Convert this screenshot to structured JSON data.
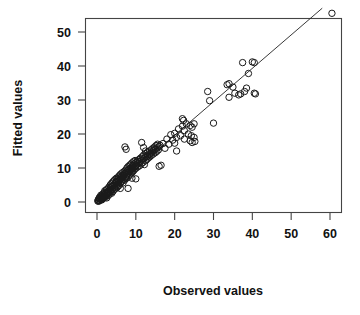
{
  "chart_data": {
    "type": "scatter",
    "title": "",
    "xlabel": "Observed values",
    "ylabel": "Fitted values",
    "xlim": [
      -2,
      63
    ],
    "ylim": [
      -2,
      58
    ],
    "xticks": [
      0,
      10,
      20,
      30,
      40,
      50,
      60
    ],
    "yticks": [
      0,
      10,
      20,
      30,
      40,
      50
    ],
    "xtick_labels": [
      "0",
      "10",
      "20",
      "30",
      "40",
      "50",
      "60"
    ],
    "ytick_labels": [
      "0",
      "10",
      "20",
      "30",
      "40",
      "50"
    ],
    "grid": false,
    "legend": null,
    "marker": "open-circle",
    "marker_color": "#1a1a1a",
    "reference_line": {
      "type": "identity",
      "label": "",
      "x": [
        0,
        58
      ],
      "y": [
        0,
        57
      ],
      "color": "#222222"
    },
    "points": [
      [
        0.2,
        0.3
      ],
      [
        0.3,
        0.6
      ],
      [
        0.4,
        0.2
      ],
      [
        0.5,
        1.0
      ],
      [
        0.5,
        0.4
      ],
      [
        0.6,
        1.3
      ],
      [
        0.7,
        0.5
      ],
      [
        0.8,
        0.9
      ],
      [
        0.9,
        1.6
      ],
      [
        1.0,
        0.7
      ],
      [
        1.0,
        2.0
      ],
      [
        1.1,
        1.2
      ],
      [
        1.2,
        0.6
      ],
      [
        1.3,
        1.8
      ],
      [
        1.4,
        1.1
      ],
      [
        1.5,
        2.4
      ],
      [
        1.5,
        0.9
      ],
      [
        1.6,
        1.5
      ],
      [
        1.7,
        2.2
      ],
      [
        1.8,
        1.3
      ],
      [
        1.9,
        2.8
      ],
      [
        2.0,
        1.7
      ],
      [
        2.0,
        3.3
      ],
      [
        2.1,
        2.1
      ],
      [
        2.2,
        1.4
      ],
      [
        2.3,
        2.6
      ],
      [
        2.4,
        3.6
      ],
      [
        2.5,
        2.0
      ],
      [
        2.5,
        1.2
      ],
      [
        2.6,
        3.0
      ],
      [
        2.7,
        2.4
      ],
      [
        2.8,
        4.0
      ],
      [
        2.9,
        1.9
      ],
      [
        3.0,
        3.2
      ],
      [
        3.0,
        2.7
      ],
      [
        3.1,
        4.4
      ],
      [
        3.2,
        2.3
      ],
      [
        3.3,
        3.7
      ],
      [
        3.4,
        5.0
      ],
      [
        3.5,
        2.9
      ],
      [
        3.5,
        4.1
      ],
      [
        3.6,
        3.4
      ],
      [
        3.7,
        5.4
      ],
      [
        3.8,
        2.6
      ],
      [
        3.9,
        4.6
      ],
      [
        4.0,
        3.9
      ],
      [
        4.0,
        5.8
      ],
      [
        4.1,
        3.1
      ],
      [
        4.2,
        4.9
      ],
      [
        4.3,
        6.2
      ],
      [
        4.4,
        3.6
      ],
      [
        4.5,
        5.2
      ],
      [
        4.5,
        4.3
      ],
      [
        4.6,
        6.6
      ],
      [
        4.7,
        3.9
      ],
      [
        4.8,
        5.6
      ],
      [
        4.9,
        4.7
      ],
      [
        5.0,
        6.0
      ],
      [
        5.0,
        7.0
      ],
      [
        5.1,
        4.2
      ],
      [
        5.2,
        5.9
      ],
      [
        5.3,
        6.8
      ],
      [
        5.4,
        4.6
      ],
      [
        5.5,
        5.3
      ],
      [
        5.5,
        7.4
      ],
      [
        5.6,
        6.3
      ],
      [
        5.7,
        4.9
      ],
      [
        5.8,
        7.8
      ],
      [
        5.9,
        6.6
      ],
      [
        6.0,
        5.5
      ],
      [
        6.0,
        7.2
      ],
      [
        6.1,
        8.2
      ],
      [
        6.2,
        5.9
      ],
      [
        6.3,
        6.9
      ],
      [
        6.4,
        7.6
      ],
      [
        6.5,
        6.2
      ],
      [
        6.5,
        8.6
      ],
      [
        6.6,
        7.3
      ],
      [
        6.7,
        5.6
      ],
      [
        6.8,
        8.0
      ],
      [
        6.9,
        6.7
      ],
      [
        7.0,
        7.9
      ],
      [
        7.0,
        9.0
      ],
      [
        7.1,
        6.4
      ],
      [
        7.2,
        8.4
      ],
      [
        7.3,
        7.1
      ],
      [
        7.4,
        9.4
      ],
      [
        7.5,
        6.9
      ],
      [
        7.5,
        8.8
      ],
      [
        7.6,
        7.5
      ],
      [
        7.7,
        10.0
      ],
      [
        7.8,
        8.1
      ],
      [
        7.9,
        9.2
      ],
      [
        8.0,
        7.3
      ],
      [
        8.0,
        10.4
      ],
      [
        8.1,
        8.7
      ],
      [
        8.2,
        9.6
      ],
      [
        8.3,
        7.8
      ],
      [
        8.4,
        10.8
      ],
      [
        8.5,
        9.1
      ],
      [
        8.5,
        8.2
      ],
      [
        8.6,
        10.0
      ],
      [
        8.7,
        11.1
      ],
      [
        8.8,
        9.4
      ],
      [
        8.9,
        8.6
      ],
      [
        9.0,
        10.3
      ],
      [
        9.0,
        11.5
      ],
      [
        9.1,
        9.8
      ],
      [
        9.2,
        8.9
      ],
      [
        9.3,
        10.7
      ],
      [
        9.4,
        11.9
      ],
      [
        9.5,
        9.3
      ],
      [
        9.5,
        10.1
      ],
      [
        9.6,
        11.2
      ],
      [
        9.7,
        9.7
      ],
      [
        9.8,
        12.2
      ],
      [
        9.9,
        10.5
      ],
      [
        10.0,
        11.6
      ],
      [
        10.0,
        9.9
      ],
      [
        10.2,
        10.9
      ],
      [
        10.4,
        12.0
      ],
      [
        10.5,
        10.3
      ],
      [
        10.6,
        11.4
      ],
      [
        10.8,
        12.5
      ],
      [
        11.0,
        10.7
      ],
      [
        11.0,
        11.9
      ],
      [
        11.2,
        12.9
      ],
      [
        11.4,
        11.2
      ],
      [
        11.5,
        12.3
      ],
      [
        11.6,
        13.3
      ],
      [
        11.8,
        11.6
      ],
      [
        12.0,
        12.7
      ],
      [
        12.0,
        13.8
      ],
      [
        12.2,
        11.0
      ],
      [
        12.4,
        13.1
      ],
      [
        12.5,
        12.1
      ],
      [
        12.6,
        14.2
      ],
      [
        12.8,
        12.5
      ],
      [
        13.0,
        13.5
      ],
      [
        13.0,
        14.6
      ],
      [
        13.2,
        12.9
      ],
      [
        13.4,
        13.9
      ],
      [
        13.5,
        15.0
      ],
      [
        13.6,
        13.3
      ],
      [
        13.8,
        14.3
      ],
      [
        14.0,
        15.4
      ],
      [
        14.0,
        13.7
      ],
      [
        14.2,
        14.7
      ],
      [
        14.4,
        15.8
      ],
      [
        14.5,
        14.1
      ],
      [
        14.6,
        15.1
      ],
      [
        14.8,
        16.2
      ],
      [
        15.0,
        14.5
      ],
      [
        15.0,
        15.5
      ],
      [
        15.2,
        16.6
      ],
      [
        15.4,
        14.9
      ],
      [
        15.5,
        15.9
      ],
      [
        15.6,
        17.0
      ],
      [
        15.8,
        15.3
      ],
      [
        16.0,
        16.3
      ],
      [
        16.0,
        10.5
      ],
      [
        16.2,
        16.7
      ],
      [
        16.5,
        10.8
      ],
      [
        7.2,
        16.2
      ],
      [
        7.5,
        15.5
      ],
      [
        8.0,
        4.0
      ],
      [
        11.5,
        17.5
      ],
      [
        12.0,
        16.0
      ],
      [
        12.5,
        15.0
      ],
      [
        9.0,
        7.0
      ],
      [
        10.0,
        6.8
      ],
      [
        6.0,
        4.0
      ],
      [
        17.0,
        17.2
      ],
      [
        17.5,
        15.8
      ],
      [
        18.0,
        18.5
      ],
      [
        18.5,
        17.0
      ],
      [
        19.0,
        19.8
      ],
      [
        19.5,
        18.2
      ],
      [
        20.0,
        20.2
      ],
      [
        20.0,
        17.3
      ],
      [
        20.5,
        19.0
      ],
      [
        21.0,
        21.5
      ],
      [
        21.5,
        19.5
      ],
      [
        22.0,
        22.3
      ],
      [
        22.0,
        24.5
      ],
      [
        22.3,
        24.0
      ],
      [
        22.5,
        21.0
      ],
      [
        22.5,
        18.5
      ],
      [
        23.0,
        23.0
      ],
      [
        23.5,
        20.0
      ],
      [
        24.0,
        22.5
      ],
      [
        24.0,
        18.0
      ],
      [
        24.3,
        19.5
      ],
      [
        24.5,
        22.0
      ],
      [
        24.5,
        17.5
      ],
      [
        25.0,
        23.0
      ],
      [
        25.0,
        19.0
      ],
      [
        25.2,
        17.8
      ],
      [
        20.5,
        15.0
      ],
      [
        28.5,
        32.5
      ],
      [
        29.0,
        29.8
      ],
      [
        30.0,
        23.2
      ],
      [
        33.5,
        34.5
      ],
      [
        34.0,
        34.8
      ],
      [
        34.0,
        30.8
      ],
      [
        35.0,
        33.8
      ],
      [
        35.5,
        32.0
      ],
      [
        36.5,
        31.5
      ],
      [
        37.0,
        31.8
      ],
      [
        37.5,
        41.0
      ],
      [
        38.0,
        32.5
      ],
      [
        38.5,
        33.5
      ],
      [
        39.0,
        37.8
      ],
      [
        40.0,
        41.2
      ],
      [
        40.5,
        41.0
      ],
      [
        40.5,
        32.0
      ],
      [
        40.8,
        31.8
      ],
      [
        60.5,
        55.5
      ]
    ]
  },
  "axes": {
    "x_title": "Observed values",
    "y_title": "Fitted values"
  }
}
